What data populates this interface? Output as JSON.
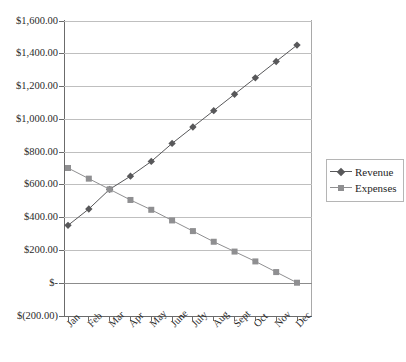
{
  "chart_data": {
    "type": "line",
    "title": "",
    "xlabel": "",
    "ylabel": "",
    "categories": [
      "Jan",
      "Feb",
      "Mar",
      "Apr",
      "May",
      "June",
      "July",
      "Aug",
      "Sept",
      "Oct",
      "Nov",
      "Dec"
    ],
    "ylim": [
      -200,
      1600
    ],
    "ytick_values": [
      1600,
      1400,
      1200,
      1000,
      800,
      600,
      400,
      200,
      0,
      -200
    ],
    "ytick_labels": [
      "$1,600.00",
      "$1,400.00",
      "$1,200.00",
      "$1,000.00",
      "$800.00",
      "$600.00",
      "$400.00",
      "$200.00",
      "$-",
      "$(200.00)"
    ],
    "grid": true,
    "legend_position": "right",
    "series": [
      {
        "name": "Revenue",
        "marker": "diamond",
        "color": "#58585a",
        "values": [
          350,
          450,
          570,
          650,
          740,
          850,
          950,
          1050,
          1150,
          1250,
          1350,
          1450
        ]
      },
      {
        "name": "Expenses",
        "marker": "square",
        "color": "#8f8f91",
        "values": [
          700,
          635,
          570,
          505,
          445,
          380,
          315,
          250,
          190,
          130,
          65,
          0
        ]
      }
    ]
  },
  "legend": {
    "items": [
      {
        "label": "Revenue",
        "marker": "diamond",
        "color": "#58585a"
      },
      {
        "label": "Expenses",
        "marker": "square",
        "color": "#8f8f91"
      }
    ]
  }
}
